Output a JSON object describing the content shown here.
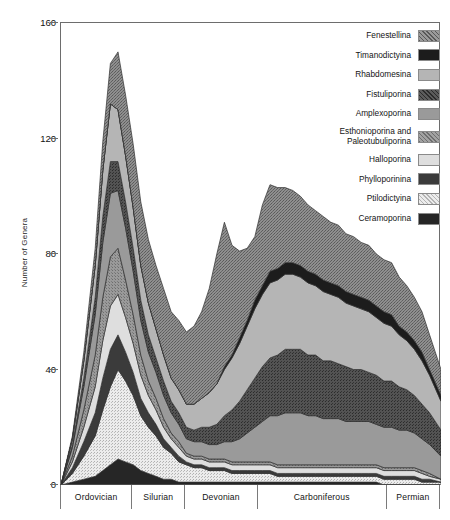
{
  "chart_data": {
    "type": "area",
    "title": "",
    "xlabel": "",
    "ylabel": "Number of Genera",
    "ylim": [
      0,
      160
    ],
    "yticks": [
      0,
      40,
      80,
      120,
      160
    ],
    "grid": false,
    "stacked": true,
    "legend_position": "top-right",
    "x_periods": [
      {
        "name": "Ordovician",
        "start": 0,
        "end": 19
      },
      {
        "name": "Silurian",
        "start": 19,
        "end": 33
      },
      {
        "name": "Devonian",
        "start": 33,
        "end": 52
      },
      {
        "name": "Carboniferous",
        "start": 52,
        "end": 86
      },
      {
        "name": "Permian",
        "start": 86,
        "end": 100
      }
    ],
    "x": [
      0,
      3,
      6,
      9,
      11,
      13,
      15,
      17,
      19,
      21,
      23,
      25,
      27,
      29,
      31,
      33,
      35,
      37,
      39,
      41,
      43,
      45,
      47,
      49,
      51,
      53,
      55,
      57,
      59,
      61,
      63,
      65,
      67,
      69,
      71,
      73,
      75,
      77,
      79,
      81,
      83,
      85,
      87,
      89,
      91,
      93,
      95,
      97,
      100
    ],
    "series": [
      {
        "name": "Ceramoporina",
        "color": "#262626",
        "pattern": "solid",
        "values": [
          0,
          1,
          2,
          3,
          5,
          7,
          9,
          8,
          7,
          5,
          4,
          3,
          2,
          2,
          1,
          1,
          1,
          1,
          1,
          1,
          1,
          1,
          1,
          1,
          1,
          1,
          1,
          1,
          1,
          1,
          1,
          1,
          1,
          1,
          1,
          1,
          1,
          1,
          1,
          1,
          1,
          0,
          0,
          0,
          0,
          0,
          0,
          0,
          0
        ]
      },
      {
        "name": "Ptilodictyina",
        "color": "#e0e0e0",
        "pattern": "stipple-light",
        "values": [
          0,
          3,
          8,
          14,
          21,
          27,
          31,
          28,
          24,
          19,
          16,
          14,
          11,
          9,
          7,
          6,
          5,
          5,
          4,
          4,
          4,
          3,
          3,
          3,
          3,
          3,
          3,
          2,
          2,
          2,
          2,
          2,
          2,
          2,
          2,
          2,
          2,
          2,
          2,
          2,
          2,
          2,
          2,
          2,
          2,
          2,
          1,
          1,
          1
        ]
      },
      {
        "name": "Phylloporinina",
        "color": "#3b3b3b",
        "pattern": "solid",
        "values": [
          0,
          2,
          5,
          8,
          11,
          13,
          12,
          10,
          8,
          6,
          5,
          4,
          3,
          2,
          2,
          1,
          1,
          1,
          1,
          1,
          1,
          1,
          1,
          1,
          1,
          1,
          1,
          1,
          1,
          1,
          1,
          1,
          1,
          1,
          1,
          1,
          1,
          1,
          1,
          1,
          1,
          1,
          1,
          1,
          1,
          1,
          1,
          1,
          0
        ]
      },
      {
        "name": "Halloporina",
        "color": "#dedede",
        "pattern": "solid",
        "values": [
          0,
          2,
          5,
          9,
          13,
          15,
          14,
          12,
          10,
          8,
          6,
          5,
          4,
          3,
          3,
          2,
          2,
          2,
          2,
          2,
          2,
          2,
          2,
          2,
          2,
          2,
          2,
          2,
          2,
          2,
          2,
          2,
          2,
          2,
          2,
          2,
          2,
          2,
          2,
          2,
          2,
          2,
          2,
          2,
          2,
          2,
          2,
          1,
          1
        ]
      },
      {
        "name": "Esthonioporina and\nPaleotubuliporina",
        "color": "#8f8f8f",
        "pattern": "stipple-mid",
        "values": [
          0,
          2,
          6,
          11,
          15,
          17,
          16,
          13,
          10,
          7,
          5,
          4,
          3,
          2,
          2,
          1,
          1,
          1,
          1,
          1,
          1,
          1,
          1,
          1,
          1,
          1,
          1,
          1,
          1,
          1,
          1,
          1,
          1,
          1,
          1,
          1,
          1,
          1,
          1,
          1,
          1,
          1,
          1,
          1,
          1,
          1,
          1,
          1,
          0
        ]
      },
      {
        "name": "Amplexoporina",
        "color": "#9a9a9a",
        "pattern": "solid",
        "values": [
          0,
          3,
          8,
          14,
          19,
          22,
          20,
          18,
          15,
          12,
          10,
          9,
          8,
          7,
          6,
          5,
          5,
          5,
          5,
          5,
          6,
          7,
          8,
          10,
          12,
          14,
          16,
          17,
          18,
          18,
          18,
          17,
          17,
          16,
          16,
          16,
          15,
          15,
          15,
          15,
          14,
          14,
          14,
          13,
          13,
          12,
          11,
          10,
          8
        ]
      },
      {
        "name": "Fistuliporina",
        "color": "#4c4c4c",
        "pattern": "stipple-dark",
        "values": [
          0,
          1,
          3,
          6,
          9,
          11,
          10,
          9,
          8,
          7,
          6,
          5,
          5,
          4,
          4,
          4,
          4,
          5,
          6,
          7,
          9,
          11,
          13,
          15,
          17,
          19,
          20,
          21,
          22,
          22,
          22,
          21,
          21,
          20,
          20,
          19,
          19,
          18,
          18,
          17,
          17,
          16,
          16,
          15,
          14,
          13,
          12,
          11,
          9
        ]
      },
      {
        "name": "Rhabdomesina",
        "color": "#b5b5b5",
        "pattern": "solid",
        "values": [
          0,
          2,
          6,
          11,
          16,
          20,
          18,
          16,
          14,
          12,
          11,
          10,
          9,
          8,
          8,
          8,
          9,
          10,
          12,
          14,
          16,
          18,
          20,
          22,
          24,
          25,
          26,
          26,
          26,
          26,
          25,
          25,
          24,
          24,
          23,
          23,
          22,
          22,
          21,
          21,
          20,
          20,
          19,
          18,
          17,
          16,
          15,
          13,
          10
        ]
      },
      {
        "name": "Timanodictyina",
        "color": "#1c1c1c",
        "pattern": "solid",
        "values": [
          0,
          0,
          0,
          0,
          0,
          0,
          0,
          0,
          0,
          0,
          0,
          0,
          0,
          0,
          0,
          0,
          0,
          0,
          0,
          0,
          1,
          1,
          2,
          2,
          3,
          3,
          4,
          4,
          4,
          4,
          4,
          4,
          4,
          4,
          4,
          4,
          4,
          4,
          4,
          4,
          4,
          4,
          4,
          3,
          3,
          3,
          3,
          2,
          2
        ]
      },
      {
        "name": "Fenestellina",
        "color": "#8a8a8a",
        "pattern": "stipple-coarse",
        "values": [
          0,
          1,
          3,
          6,
          10,
          14,
          20,
          21,
          22,
          22,
          22,
          22,
          23,
          23,
          24,
          25,
          27,
          30,
          36,
          45,
          50,
          38,
          30,
          25,
          22,
          28,
          30,
          28,
          26,
          25,
          24,
          23,
          22,
          22,
          21,
          21,
          20,
          20,
          19,
          19,
          18,
          18,
          18,
          17,
          16,
          15,
          14,
          12,
          9
        ]
      }
    ],
    "totals_note": "stacked totals peak near 159 in Ordovician"
  },
  "axis": {
    "y_label": "Number of Genera",
    "y_ticks": [
      "0",
      "40",
      "80",
      "120",
      "160"
    ]
  },
  "legend": {
    "items": [
      {
        "label": "Fenestellina",
        "swatch": "swatch-fenestellina"
      },
      {
        "label": "Timanodictyina",
        "swatch": "swatch-timanodictyina"
      },
      {
        "label": "Rhabdomesina",
        "swatch": "swatch-rhabdomesina"
      },
      {
        "label": "Fistuliporina",
        "swatch": "swatch-fistuliporina"
      },
      {
        "label": "Amplexoporina",
        "swatch": "swatch-amplexoporina"
      },
      {
        "label": "Esthonioporina and\nPaleotubuliporina",
        "swatch": "swatch-esthonioporina"
      },
      {
        "label": "Halloporina",
        "swatch": "swatch-halloporina"
      },
      {
        "label": "Phylloporinina",
        "swatch": "swatch-phylloporinina"
      },
      {
        "label": "Ptilodictyina",
        "swatch": "swatch-ptilodictyina"
      },
      {
        "label": "Ceramoporina",
        "swatch": "swatch-ceramoporina"
      }
    ]
  },
  "periods": {
    "items": [
      {
        "name": "Ordovician"
      },
      {
        "name": "Silurian"
      },
      {
        "name": "Devonian"
      },
      {
        "name": "Carboniferous"
      },
      {
        "name": "Permian"
      }
    ]
  }
}
